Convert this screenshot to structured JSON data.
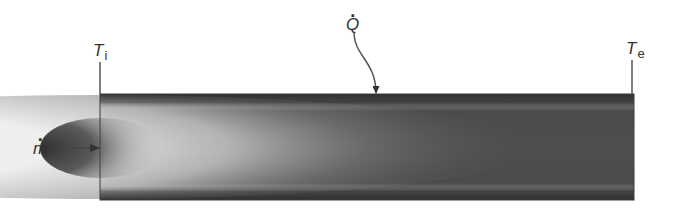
{
  "diagram": {
    "labels": {
      "inlet_temperature": {
        "symbol": "T",
        "subscript": "i"
      },
      "exit_temperature": {
        "symbol": "T",
        "subscript": "e"
      },
      "heat_rate": {
        "symbol": "Q",
        "overdot": true
      },
      "mass_flow_rate": {
        "symbol": "m",
        "overdot": true
      }
    },
    "colors": {
      "background": "#ffffff",
      "pipe_wall": "#4a4a4a",
      "hot_core": "#f2f2f2",
      "cold_inlet_core": "#333333",
      "line": "#555555"
    },
    "geometry": {
      "pipe": {
        "x": 100,
        "y": 94,
        "width": 534,
        "height": 106
      },
      "inlet_line": {
        "x": 100,
        "y1": 62,
        "y2": 94
      },
      "exit_line": {
        "x": 632,
        "y1": 60,
        "y2": 94
      },
      "heat_arrow_tip": {
        "x": 376,
        "y": 94
      },
      "mass_arrow": {
        "x1": 55,
        "x2": 100,
        "y": 148
      }
    }
  }
}
